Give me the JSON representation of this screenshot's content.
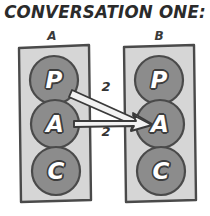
{
  "title": "CONVERSATION ONE:",
  "palette": {
    "box_fill": "#d6d6d6",
    "box_stroke": "#4a4a4a",
    "circle_fill": "#8c8c8c",
    "circle_stroke": "#4a4a4a",
    "letter_fill": "#ffffff",
    "letter_stroke": "#3d3d3d",
    "arrow_fill": "#f2f2f2",
    "arrow_stroke": "#3a3a3a",
    "background": "#ffffff"
  },
  "persons": [
    {
      "label": "A",
      "states": [
        {
          "letter": "P",
          "name": "parent"
        },
        {
          "letter": "A",
          "name": "adult"
        },
        {
          "letter": "C",
          "name": "child"
        }
      ]
    },
    {
      "label": "B",
      "states": [
        {
          "letter": "P",
          "name": "parent"
        },
        {
          "letter": "A",
          "name": "adult"
        },
        {
          "letter": "C",
          "name": "child"
        }
      ]
    }
  ],
  "transactions": [
    {
      "id": "parent-to-adult",
      "weight": "2",
      "from": "A.P",
      "to": "B.A"
    },
    {
      "id": "adult-to-adult",
      "weight": "2",
      "from": "A.A",
      "to": "B.A"
    }
  ]
}
